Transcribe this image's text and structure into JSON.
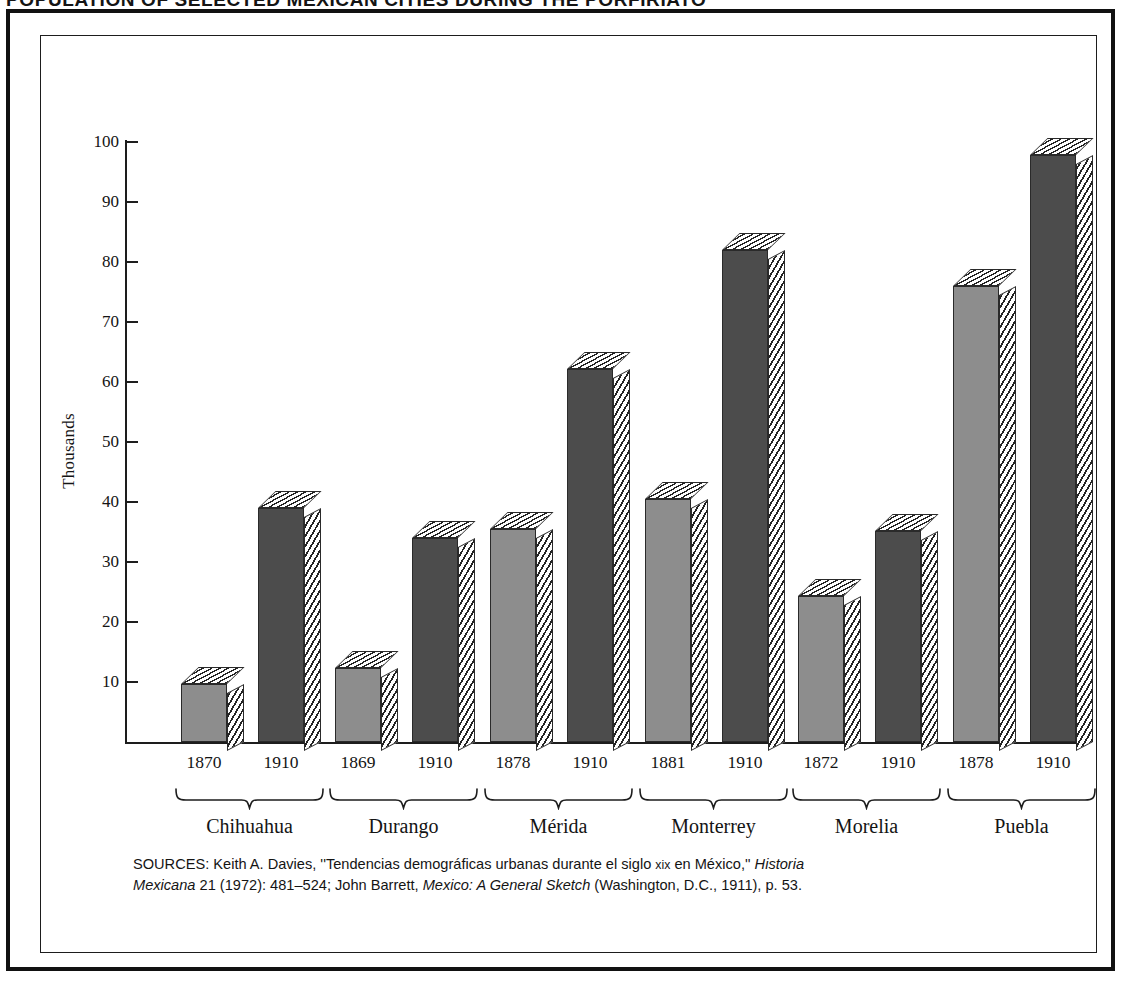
{
  "title_cropped": "POPULATION OF SELECTED MEXICAN CITIES DURING THE PORFIRIATO",
  "axis": {
    "y_title": "Thousands",
    "y_ticks": [
      10,
      20,
      30,
      40,
      50,
      60,
      70,
      80,
      90,
      100
    ],
    "y_min": 0,
    "y_max": 100
  },
  "colors": {
    "bar_early": "#8d8d8d",
    "bar_1910": "#4c4c4c",
    "outline": "#2a2a2a",
    "frame": "#111111",
    "text": "#141414"
  },
  "groups": [
    {
      "name": "Chihuahua",
      "bars": [
        {
          "year": "1870",
          "value": 9.7,
          "shade": "light"
        },
        {
          "year": "1910",
          "value": 39.0,
          "shade": "dark"
        }
      ]
    },
    {
      "name": "Durango",
      "bars": [
        {
          "year": "1869",
          "value": 12.4,
          "shade": "light"
        },
        {
          "year": "1910",
          "value": 34.0,
          "shade": "dark"
        }
      ]
    },
    {
      "name": "Mérida",
      "bars": [
        {
          "year": "1878",
          "value": 35.5,
          "shade": "light"
        },
        {
          "year": "1910",
          "value": 62.2,
          "shade": "dark"
        }
      ]
    },
    {
      "name": "Monterrey",
      "bars": [
        {
          "year": "1881",
          "value": 40.5,
          "shade": "light"
        },
        {
          "year": "1910",
          "value": 82.0,
          "shade": "dark"
        }
      ]
    },
    {
      "name": "Morelia",
      "bars": [
        {
          "year": "1872",
          "value": 24.3,
          "shade": "light"
        },
        {
          "year": "1910",
          "value": 35.2,
          "shade": "dark"
        }
      ]
    },
    {
      "name": "Puebla",
      "bars": [
        {
          "year": "1878",
          "value": 76.0,
          "shade": "light"
        },
        {
          "year": "1910",
          "value": 97.8,
          "shade": "dark"
        }
      ]
    }
  ],
  "sources": {
    "label": "SOURCES:",
    "line1_a": " Keith A. Davies, ''Tendencias demográficas urbanas durante el siglo ",
    "line1_sc": "xix",
    "line1_b": " en México,'' ",
    "line1_italic": "Historia",
    "line2_italic_a": "Mexicana",
    "line2_a": " 21 (1972): 481–524; John Barrett, ",
    "line2_italic_b": "Mexico: A General Sketch",
    "line2_b": " (Washington, D.C., 1911), p. 53."
  },
  "chart_data": {
    "type": "bar",
    "title": "POPULATION OF SELECTED MEXICAN CITIES DURING THE PORFIRIATO",
    "xlabel": "",
    "ylabel": "Thousands",
    "ylim": [
      0,
      100
    ],
    "y_ticks": [
      10,
      20,
      30,
      40,
      50,
      60,
      70,
      80,
      90,
      100
    ],
    "grid": false,
    "legend": "none",
    "categories": [
      "Chihuahua",
      "Durango",
      "Mérida",
      "Monterrey",
      "Morelia",
      "Puebla"
    ],
    "series": [
      {
        "name": "Earlier census year",
        "year_labels": [
          "1870",
          "1869",
          "1878",
          "1881",
          "1872",
          "1878"
        ],
        "values": [
          9.7,
          12.4,
          35.5,
          40.5,
          24.3,
          76.0
        ]
      },
      {
        "name": "1910",
        "year_labels": [
          "1910",
          "1910",
          "1910",
          "1910",
          "1910",
          "1910"
        ],
        "values": [
          39.0,
          34.0,
          62.2,
          82.0,
          35.2,
          97.8
        ]
      }
    ],
    "units": "thousands of inhabitants"
  }
}
